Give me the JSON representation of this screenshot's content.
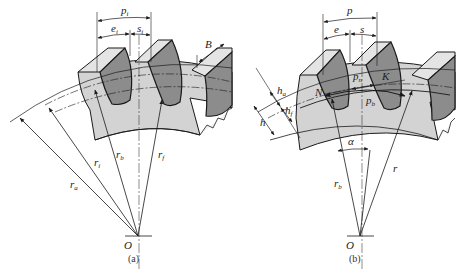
{
  "figure": {
    "colors": {
      "tooth_side": "#8c8c8c",
      "tooth_top": "#e4e4e4",
      "body": "#d3d3d3",
      "line": "#1a1a1a"
    },
    "panel_a": {
      "caption": "(a)",
      "center_label": "O",
      "labels": {
        "pi": "p",
        "pi_sub": "i",
        "ei": "e",
        "ei_sub": "i",
        "si": "s",
        "si_sub": "i",
        "B": "B",
        "ra": "r",
        "ra_sub": "a",
        "ri": "r",
        "ri_sub": "i",
        "rb": "r",
        "rb_sub": "b",
        "rf": "r",
        "rf_sub": "f"
      }
    },
    "panel_b": {
      "caption": "(b)",
      "center_label": "O",
      "labels": {
        "p": "p",
        "e": "e",
        "s": "s",
        "pn": "p",
        "pn_sub": "n",
        "pb": "p",
        "pb_sub": "b",
        "K": "K",
        "N": "N",
        "ha": "h",
        "ha_sub": "a",
        "hf": "h",
        "hf_sub": "f",
        "h": "h",
        "alpha": "α",
        "rb": "r",
        "rb_sub": "b",
        "r": "r"
      }
    }
  }
}
